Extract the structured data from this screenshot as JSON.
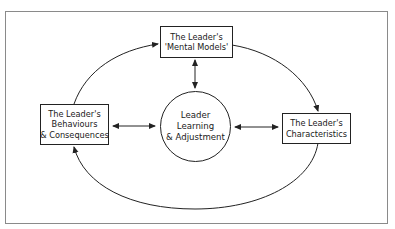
{
  "diagram": {
    "type": "cycle-with-hub",
    "colors": {
      "line": "#222222",
      "frame": "#8a8a8a",
      "background": "#ffffff",
      "text": "#1a1a1a"
    },
    "nodes": {
      "mental_models": {
        "shape": "rectangle",
        "lines": [
          "The Leader's",
          "'Mental Models'"
        ]
      },
      "characteristics": {
        "shape": "rectangle",
        "lines": [
          "The Leader's",
          "Characteristics"
        ]
      },
      "behaviours": {
        "shape": "rectangle",
        "lines": [
          "The Leader's",
          "Behaviours",
          "& Consequences"
        ]
      },
      "hub": {
        "shape": "circle",
        "lines": [
          "Leader",
          "Learning",
          "& Adjustment"
        ]
      }
    },
    "edges": [
      {
        "from": "behaviours",
        "to": "mental_models",
        "style": "curved",
        "direction": "one-way"
      },
      {
        "from": "mental_models",
        "to": "characteristics",
        "style": "curved",
        "direction": "one-way"
      },
      {
        "from": "characteristics",
        "to": "behaviours",
        "style": "curved",
        "direction": "one-way"
      },
      {
        "from": "hub",
        "to": "mental_models",
        "style": "straight",
        "direction": "two-way"
      },
      {
        "from": "hub",
        "to": "behaviours",
        "style": "straight",
        "direction": "two-way"
      },
      {
        "from": "hub",
        "to": "characteristics",
        "style": "straight",
        "direction": "two-way"
      }
    ]
  }
}
